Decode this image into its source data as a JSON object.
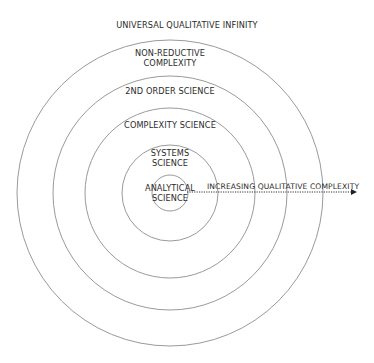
{
  "diagram": {
    "title": "",
    "center": {
      "x": 170,
      "y": 193
    },
    "stroke_color": "#9a9a9a",
    "text_color": "#2b2b2b",
    "rings": [
      {
        "name": "analytical-science",
        "radius": 18
      },
      {
        "name": "systems-science",
        "radius": 48
      },
      {
        "name": "complexity-science",
        "radius": 85
      },
      {
        "name": "2nd-order-science",
        "radius": 117
      },
      {
        "name": "non-reductive-complexity",
        "radius": 153
      }
    ],
    "labels": {
      "outer": "UNIVERSAL QUALITATIVE INFINITY",
      "non_reductive_line1": "NON-REDUCTIVE",
      "non_reductive_line2": "COMPLEXITY",
      "second_order": "2ND ORDER SCIENCE",
      "complexity": "COMPLEXITY SCIENCE",
      "systems_line1": "SYSTEMS",
      "systems_line2": "SCIENCE",
      "analytical_line1": "ANALYTICAL",
      "analytical_line2": "SCIENCE"
    },
    "arrow": {
      "label": "INCREASING QUALITATIVE COMPLEXITY",
      "style": "dotted",
      "x_start": 188,
      "x_end": 355,
      "y": 192
    }
  }
}
